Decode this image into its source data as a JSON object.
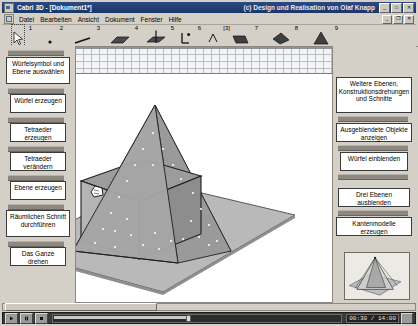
{
  "window": {
    "app_icon": "app-icon",
    "title": "Cabri 3D - [Dokument1*]",
    "credit": "(c) Design und Realisation von Olaf Knapp",
    "buttons": {
      "minimize": "_",
      "maximize": "□",
      "close": "✕"
    }
  },
  "menu": {
    "doc_icon": "document-icon",
    "items": [
      {
        "label": "Datei"
      },
      {
        "label": "Bearbeiten"
      },
      {
        "label": "Ansicht"
      },
      {
        "label": "Dokument"
      },
      {
        "label": "Fenster"
      },
      {
        "label": "Hilfe"
      }
    ],
    "mdi_buttons": {
      "minimize": "_",
      "restore": "❐",
      "close": "✕"
    }
  },
  "toolbar": {
    "tools": [
      {
        "num": "1",
        "name": "pointer-tool"
      },
      {
        "num": "2",
        "name": "point-tool"
      },
      {
        "num": "3",
        "name": "line-tool"
      },
      {
        "num": "4",
        "name": "plane-tool"
      },
      {
        "num": "5",
        "name": "perpendicular-tool"
      },
      {
        "num": "6",
        "name": "vector-tool"
      },
      {
        "num": "[3]",
        "name": "polygon-tool"
      },
      {
        "num": "7",
        "name": "prism-tool"
      },
      {
        "num": "8",
        "name": "tetrahedron-tool"
      },
      {
        "num": "9",
        "name": "pyramid-tool"
      }
    ]
  },
  "left_panel": {
    "steps": [
      {
        "label": "Würfelsymbol und Ebene auswählen"
      },
      {
        "label": "Würfel erzeugen"
      },
      {
        "label": "Tetraeder erzeugen"
      },
      {
        "label": "Tetraeder verändern"
      },
      {
        "label": "Ebene erzeugen"
      },
      {
        "label": "Räumlichen Schnitt durchführen"
      },
      {
        "label": "Das Ganze drehen"
      }
    ]
  },
  "right_panel": {
    "steps": [
      {
        "label": "Weitere Ebenen, Konstruktionsdrehungen und Schnitte"
      },
      {
        "label": "Ausgeblendete Objekte anzeigen"
      },
      {
        "label": "Würfel einblenden"
      },
      {
        "label": "Drei Ebenen ausblenden"
      },
      {
        "label": "Kantenmodelle erzeugen"
      }
    ],
    "thumbnail": "scene-thumbnail"
  },
  "scene": {
    "name": "cabri-3d-scene",
    "objects": [
      {
        "name": "ground-plane"
      },
      {
        "name": "cube"
      },
      {
        "name": "tetrahedron"
      },
      {
        "name": "cutting-plane"
      },
      {
        "name": "cursor-hand"
      }
    ]
  },
  "player": {
    "play": "▶",
    "pause": "❚❚",
    "stop": "■",
    "time": "00:30 / 14:00",
    "volume": "volume-icon",
    "progress_percent": 46
  }
}
